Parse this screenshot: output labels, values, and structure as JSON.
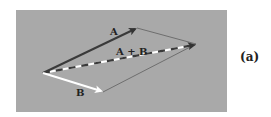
{
  "figure": {
    "panel_label": "(a)",
    "background_color": "#a9a9a9",
    "panel": {
      "x": 16,
      "y": 10,
      "width": 211,
      "height": 102
    }
  },
  "vectors": {
    "origin": {
      "x": 43,
      "y": 73
    },
    "A": {
      "label": "A",
      "tip": {
        "x": 137,
        "y": 28
      },
      "color": "#3a3a3a",
      "style": "solid"
    },
    "B": {
      "label": "B",
      "tip": {
        "x": 103,
        "y": 92
      },
      "color": "#ffffff",
      "style": "solid"
    },
    "sum": {
      "label": "A + B",
      "tip": {
        "x": 196,
        "y": 44
      },
      "colors": [
        "#3a3a3a",
        "#ffffff"
      ],
      "style": "dashed"
    }
  },
  "parallelogram_edges": {
    "color": "#555555",
    "style": "thin"
  }
}
